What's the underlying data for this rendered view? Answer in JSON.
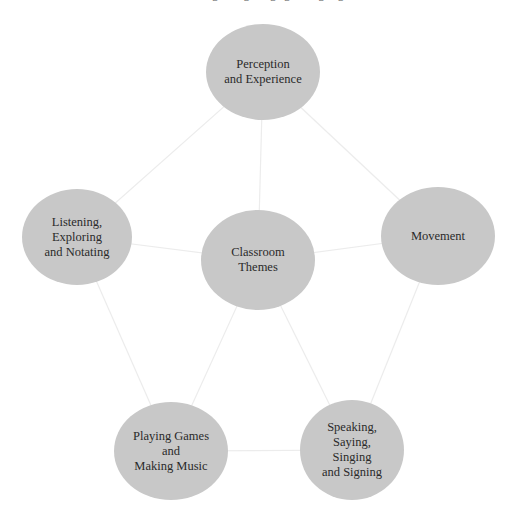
{
  "header": {
    "running_title": "Learning through singing and signing",
    "page_number": ""
  },
  "diagram": {
    "type": "hub-and-spoke concept map",
    "center_node": "center",
    "colors": {
      "node_fill": "#c8c8c8",
      "edge": "#ececec",
      "text": "#2a2a2a",
      "background": "#ffffff"
    },
    "nodes": {
      "top": {
        "label": "Perception\nand Experience",
        "cx": 263,
        "cy": 72,
        "rx": 57,
        "ry": 48
      },
      "left": {
        "label": "Listening,\nExploring\nand Notating",
        "cx": 77,
        "cy": 237,
        "rx": 55,
        "ry": 48
      },
      "center": {
        "label": "Classroom\nThemes",
        "cx": 258,
        "cy": 260,
        "rx": 57,
        "ry": 50
      },
      "right": {
        "label": "Movement",
        "cx": 438,
        "cy": 236,
        "rx": 57,
        "ry": 49
      },
      "bottom_left": {
        "label": "Playing Games\nand\nMaking Music",
        "cx": 171,
        "cy": 451,
        "rx": 57,
        "ry": 49
      },
      "bottom_right": {
        "label": "Speaking,\nSaying,\nSinging\nand Signing",
        "cx": 352,
        "cy": 450,
        "rx": 52,
        "ry": 50
      }
    },
    "edges": [
      [
        "top",
        "left"
      ],
      [
        "top",
        "center"
      ],
      [
        "top",
        "right"
      ],
      [
        "left",
        "center"
      ],
      [
        "center",
        "right"
      ],
      [
        "left",
        "bottom_left"
      ],
      [
        "center",
        "bottom_left"
      ],
      [
        "center",
        "bottom_right"
      ],
      [
        "right",
        "bottom_right"
      ],
      [
        "bottom_left",
        "bottom_right"
      ]
    ]
  }
}
